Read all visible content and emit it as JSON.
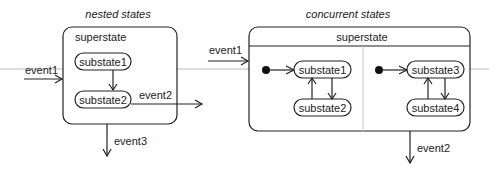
{
  "nested": {
    "title": "nested states",
    "superstate": "superstate",
    "substate1": "substate1",
    "substate2": "substate2",
    "event1": "event1",
    "event2": "event2",
    "event3": "event3"
  },
  "concurrent": {
    "title": "concurrent states",
    "superstate": "superstate",
    "substate1": "substate1",
    "substate2": "substate2",
    "substate3": "substate3",
    "substate4": "substate4",
    "event1": "event1",
    "event2": "event2"
  }
}
